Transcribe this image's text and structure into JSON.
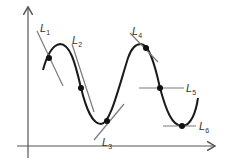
{
  "diagram": {
    "title": "",
    "axes": {
      "x_arrow": true,
      "y_arrow": true
    },
    "curve": "wave (sine-like) with two peaks and two troughs",
    "tangent_lines": [
      {
        "id": "L1",
        "label": "L",
        "sub": "1",
        "point": [
          49,
          58
        ],
        "slope_desc": "steep negative (secant-like)"
      },
      {
        "id": "L2",
        "label": "L",
        "sub": "2",
        "point": [
          81,
          88
        ],
        "slope_desc": "steep negative"
      },
      {
        "id": "L3",
        "label": "L",
        "sub": "3",
        "point": [
          107,
          122
        ],
        "slope_desc": "positive"
      },
      {
        "id": "L4",
        "label": "L",
        "sub": "4",
        "point": [
          146,
          48
        ],
        "slope_desc": "negative"
      },
      {
        "id": "L5",
        "label": "L",
        "sub": "5",
        "point": [
          160,
          88
        ],
        "slope_desc": "horizontal (intersecting)"
      },
      {
        "id": "L6",
        "label": "L",
        "sub": "6",
        "point": [
          182,
          126
        ],
        "slope_desc": "horizontal (tangent at minimum)"
      }
    ],
    "colors": {
      "curve": "#1a1a1a",
      "tangent": "#7a7a7a",
      "axis": "#555555",
      "point": "#111111"
    }
  }
}
